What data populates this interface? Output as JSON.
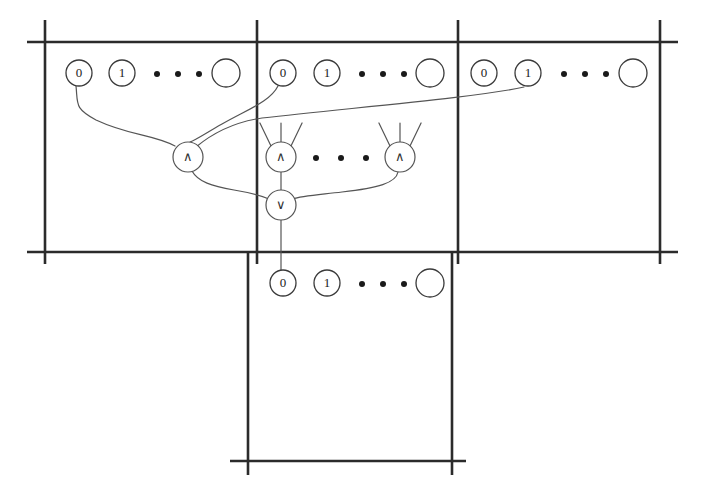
{
  "figure": {
    "kind": "logic-circuit-over-register-tape"
  },
  "colors": {
    "frame": "#2b2b2b",
    "node_stroke": "#3a3a3a",
    "wire": "#555555",
    "background": "#ffffff",
    "text": "#1a1a1a"
  },
  "frames": {
    "top_row": {
      "name": "top-tape-row",
      "left": 45,
      "right": 678,
      "top": 42,
      "bottom": 252,
      "dividers_x": [
        257,
        458
      ]
    },
    "bottom_cell": {
      "name": "bottom-tape-cell",
      "left": 248,
      "right": 452,
      "top": 252,
      "bottom": 461
    }
  },
  "cells": [
    {
      "name": "cell-1",
      "nodes": [
        {
          "name": "node-0",
          "label": "0",
          "cx": 79,
          "cy": 73,
          "r": 13
        },
        {
          "name": "node-1",
          "label": "1",
          "cx": 122,
          "cy": 73,
          "r": 13
        },
        {
          "name": "node-blank",
          "label": "",
          "cx": 226,
          "cy": 73,
          "r": 14
        }
      ],
      "ellipsis": [
        157,
        178,
        199
      ],
      "ellipsis_y": 74
    },
    {
      "name": "cell-2",
      "nodes": [
        {
          "name": "node-0",
          "label": "0",
          "cx": 283,
          "cy": 73,
          "r": 13
        },
        {
          "name": "node-1",
          "label": "1",
          "cx": 327,
          "cy": 73,
          "r": 13
        },
        {
          "name": "node-blank",
          "label": "",
          "cx": 430,
          "cy": 73,
          "r": 14
        }
      ],
      "ellipsis": [
        362,
        383,
        404
      ],
      "ellipsis_y": 74
    },
    {
      "name": "cell-3",
      "nodes": [
        {
          "name": "node-0",
          "label": "0",
          "cx": 484,
          "cy": 73,
          "r": 13
        },
        {
          "name": "node-1",
          "label": "1",
          "cx": 528,
          "cy": 73,
          "r": 13
        },
        {
          "name": "node-blank",
          "label": "",
          "cx": 633,
          "cy": 73,
          "r": 14
        }
      ],
      "ellipsis": [
        564,
        585,
        606
      ],
      "ellipsis_y": 74
    },
    {
      "name": "cell-bottom",
      "nodes": [
        {
          "name": "node-0",
          "label": "0",
          "cx": 283,
          "cy": 283,
          "r": 13
        },
        {
          "name": "node-1",
          "label": "1",
          "cx": 327,
          "cy": 283,
          "r": 13
        },
        {
          "name": "node-blank",
          "label": "",
          "cx": 430,
          "cy": 283,
          "r": 14
        }
      ],
      "ellipsis": [
        362,
        383,
        404
      ],
      "ellipsis_y": 284
    }
  ],
  "gates": [
    {
      "name": "and-gate-left",
      "label": "∧",
      "cx": 188,
      "cy": 157,
      "r": 15,
      "open_inputs": []
    },
    {
      "name": "and-gate-mid",
      "label": "∧",
      "cx": 281,
      "cy": 157,
      "r": 15,
      "open_inputs": [
        -34,
        0,
        34
      ]
    },
    {
      "name": "and-gate-right",
      "label": "∧",
      "cx": 400,
      "cy": 157,
      "r": 15,
      "open_inputs": [
        -34,
        0,
        34
      ]
    },
    {
      "name": "or-gate",
      "label": "∨",
      "cx": 281,
      "cy": 205,
      "r": 15,
      "open_inputs": []
    }
  ],
  "gate_ellipsis": {
    "dots": [
      316,
      341,
      366
    ],
    "y": 158
  },
  "wires": [
    {
      "name": "wire-cell1-zero-to-and-left",
      "from": "cell-1.node-0",
      "to": "and-gate-left",
      "path": "M 76 86 C 78 104 74 108 96 120 C 130 136 152 134 175 146"
    },
    {
      "name": "wire-cell2-zero-to-and-left",
      "from": "cell-2.node-0",
      "to": "and-gate-left",
      "path": "M 278 86 C 270 102 246 110 222 124 C 206 133 196 140 190 142"
    },
    {
      "name": "wire-cell3-one-to-and-left",
      "from": "cell-3.node-1",
      "to": "and-gate-left",
      "path": "M 524 87 C 480 97 360 107 262 118 C 228 123 208 137 196 147"
    },
    {
      "name": "wire-and-left-to-or",
      "from": "and-gate-left",
      "to": "or-gate",
      "path": "M 192 171 C 198 182 212 186 234 190 C 252 193 262 196 269 199"
    },
    {
      "name": "wire-and-mid-to-or",
      "from": "and-gate-mid",
      "to": "or-gate",
      "path": "M 281 172 L 281 190"
    },
    {
      "name": "wire-and-right-to-or",
      "from": "and-gate-right",
      "to": "or-gate",
      "path": "M 398 172 C 396 183 378 188 342 192 C 316 195 300 196 293 199"
    },
    {
      "name": "wire-or-to-bottom-zero",
      "from": "or-gate",
      "to": "cell-bottom.node-0",
      "path": "M 281 220 L 281 270"
    }
  ]
}
